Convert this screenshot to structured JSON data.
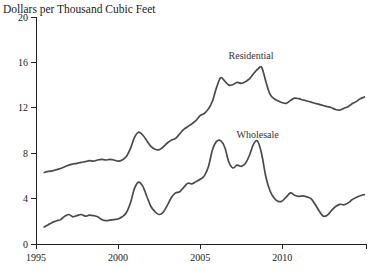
{
  "chart_data": {
    "type": "line",
    "title": "Dollars per Thousand Cubic Feet",
    "xlabel": "",
    "ylabel": "",
    "xlim": [
      1995,
      2015.1
    ],
    "ylim": [
      0,
      20
    ],
    "x_ticks": [
      1995,
      2000,
      2005,
      2010
    ],
    "y_ticks": [
      0,
      4,
      8,
      12,
      16,
      20
    ],
    "grid": false,
    "legend": "inline text annotations above each line",
    "colors": {
      "line": "#4a4a4a",
      "text": "#1a1a1a",
      "axis": "#222222",
      "background": "#ffffff"
    },
    "series": [
      {
        "name": "Residential",
        "label_pos": [
          2008.1,
          16.3
        ],
        "points": [
          [
            1995.5,
            6.3
          ],
          [
            1995.75,
            6.4
          ],
          [
            1996,
            6.45
          ],
          [
            1996.25,
            6.55
          ],
          [
            1996.5,
            6.65
          ],
          [
            1996.75,
            6.8
          ],
          [
            1997,
            6.95
          ],
          [
            1997.25,
            7.05
          ],
          [
            1997.5,
            7.1
          ],
          [
            1997.75,
            7.2
          ],
          [
            1998,
            7.25
          ],
          [
            1998.25,
            7.35
          ],
          [
            1998.5,
            7.3
          ],
          [
            1998.75,
            7.4
          ],
          [
            1999,
            7.45
          ],
          [
            1999.25,
            7.4
          ],
          [
            1999.5,
            7.45
          ],
          [
            1999.75,
            7.4
          ],
          [
            2000,
            7.3
          ],
          [
            2000.25,
            7.4
          ],
          [
            2000.5,
            7.7
          ],
          [
            2000.75,
            8.4
          ],
          [
            2001,
            9.4
          ],
          [
            2001.25,
            9.85
          ],
          [
            2001.5,
            9.6
          ],
          [
            2001.75,
            9.1
          ],
          [
            2002,
            8.6
          ],
          [
            2002.25,
            8.35
          ],
          [
            2002.5,
            8.3
          ],
          [
            2002.75,
            8.55
          ],
          [
            2003,
            8.9
          ],
          [
            2003.25,
            9.15
          ],
          [
            2003.5,
            9.3
          ],
          [
            2003.75,
            9.7
          ],
          [
            2004,
            10.1
          ],
          [
            2004.25,
            10.35
          ],
          [
            2004.5,
            10.6
          ],
          [
            2004.75,
            10.9
          ],
          [
            2005,
            11.3
          ],
          [
            2005.25,
            11.5
          ],
          [
            2005.5,
            11.9
          ],
          [
            2005.75,
            12.6
          ],
          [
            2006,
            13.8
          ],
          [
            2006.25,
            14.65
          ],
          [
            2006.5,
            14.35
          ],
          [
            2006.75,
            14
          ],
          [
            2007,
            14.05
          ],
          [
            2007.25,
            14.25
          ],
          [
            2007.5,
            14.15
          ],
          [
            2007.75,
            14.3
          ],
          [
            2008,
            14.55
          ],
          [
            2008.25,
            15
          ],
          [
            2008.5,
            15.4
          ],
          [
            2008.75,
            15.55
          ],
          [
            2009,
            14.3
          ],
          [
            2009.25,
            13.2
          ],
          [
            2009.5,
            12.8
          ],
          [
            2009.75,
            12.6
          ],
          [
            2010,
            12.45
          ],
          [
            2010.25,
            12.4
          ],
          [
            2010.5,
            12.65
          ],
          [
            2010.75,
            12.85
          ],
          [
            2011,
            12.8
          ],
          [
            2011.25,
            12.7
          ],
          [
            2011.5,
            12.6
          ],
          [
            2011.75,
            12.5
          ],
          [
            2012,
            12.4
          ],
          [
            2012.25,
            12.3
          ],
          [
            2012.5,
            12.2
          ],
          [
            2012.75,
            12.1
          ],
          [
            2013,
            12
          ],
          [
            2013.25,
            11.85
          ],
          [
            2013.5,
            11.8
          ],
          [
            2013.75,
            11.95
          ],
          [
            2014,
            12.1
          ],
          [
            2014.25,
            12.35
          ],
          [
            2014.5,
            12.55
          ],
          [
            2014.75,
            12.8
          ],
          [
            2015,
            12.95
          ]
        ]
      },
      {
        "name": "Wholesale",
        "label_pos": [
          2008.5,
          9.35
        ],
        "points": [
          [
            1995.5,
            1.5
          ],
          [
            1995.75,
            1.7
          ],
          [
            1996,
            1.9
          ],
          [
            1996.25,
            2.05
          ],
          [
            1996.5,
            2.15
          ],
          [
            1996.75,
            2.45
          ],
          [
            1997,
            2.6
          ],
          [
            1997.25,
            2.4
          ],
          [
            1997.5,
            2.5
          ],
          [
            1997.75,
            2.6
          ],
          [
            1998,
            2.45
          ],
          [
            1998.25,
            2.55
          ],
          [
            1998.5,
            2.5
          ],
          [
            1998.75,
            2.4
          ],
          [
            1999,
            2.15
          ],
          [
            1999.25,
            2.05
          ],
          [
            1999.5,
            2.1
          ],
          [
            1999.75,
            2.15
          ],
          [
            2000,
            2.2
          ],
          [
            2000.25,
            2.4
          ],
          [
            2000.5,
            2.75
          ],
          [
            2000.75,
            3.6
          ],
          [
            2001,
            4.9
          ],
          [
            2001.25,
            5.45
          ],
          [
            2001.5,
            5.1
          ],
          [
            2001.75,
            4.2
          ],
          [
            2002,
            3.3
          ],
          [
            2002.25,
            2.85
          ],
          [
            2002.5,
            2.6
          ],
          [
            2002.75,
            2.8
          ],
          [
            2003,
            3.4
          ],
          [
            2003.25,
            4.1
          ],
          [
            2003.5,
            4.5
          ],
          [
            2003.75,
            4.6
          ],
          [
            2004,
            5
          ],
          [
            2004.25,
            5.35
          ],
          [
            2004.5,
            5.3
          ],
          [
            2004.75,
            5.5
          ],
          [
            2005,
            5.7
          ],
          [
            2005.25,
            6
          ],
          [
            2005.5,
            6.8
          ],
          [
            2005.75,
            8.3
          ],
          [
            2006,
            9.05
          ],
          [
            2006.25,
            9.1
          ],
          [
            2006.5,
            8.5
          ],
          [
            2006.75,
            7.2
          ],
          [
            2007,
            6.7
          ],
          [
            2007.25,
            6.95
          ],
          [
            2007.5,
            6.85
          ],
          [
            2007.75,
            7.1
          ],
          [
            2008,
            7.8
          ],
          [
            2008.25,
            8.8
          ],
          [
            2008.5,
            9.05
          ],
          [
            2008.75,
            7.9
          ],
          [
            2009,
            5.9
          ],
          [
            2009.25,
            4.7
          ],
          [
            2009.5,
            4.05
          ],
          [
            2009.75,
            3.75
          ],
          [
            2010,
            3.8
          ],
          [
            2010.25,
            4.15
          ],
          [
            2010.5,
            4.5
          ],
          [
            2010.75,
            4.3
          ],
          [
            2011,
            4.2
          ],
          [
            2011.25,
            4.25
          ],
          [
            2011.5,
            4.15
          ],
          [
            2011.75,
            4
          ],
          [
            2012,
            3.5
          ],
          [
            2012.25,
            2.9
          ],
          [
            2012.5,
            2.45
          ],
          [
            2012.75,
            2.55
          ],
          [
            2013,
            2.95
          ],
          [
            2013.25,
            3.3
          ],
          [
            2013.5,
            3.5
          ],
          [
            2013.75,
            3.45
          ],
          [
            2014,
            3.6
          ],
          [
            2014.25,
            3.9
          ],
          [
            2014.5,
            4.1
          ],
          [
            2014.75,
            4.25
          ],
          [
            2015,
            4.35
          ]
        ]
      }
    ]
  }
}
